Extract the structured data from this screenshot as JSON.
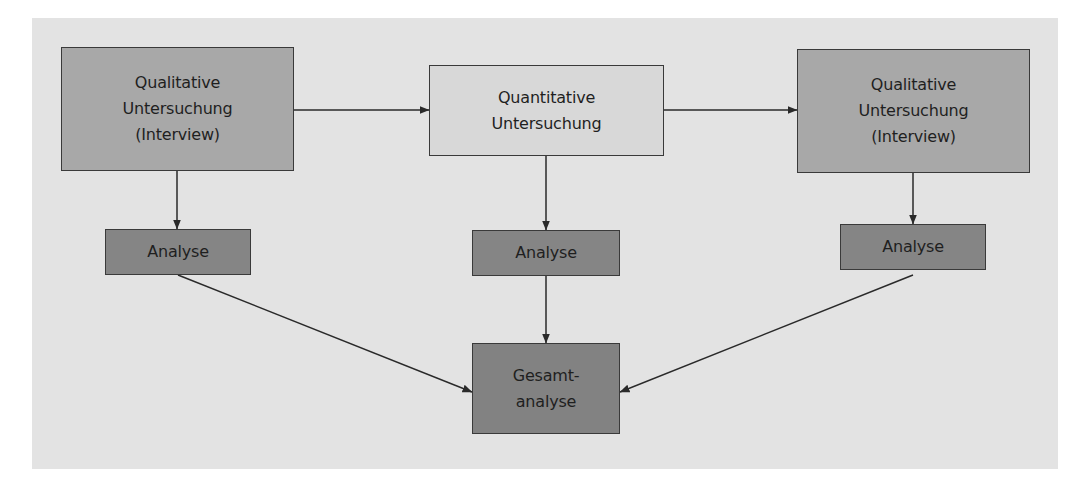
{
  "diagram": {
    "colors": {
      "background_panel": "#e3e3e3",
      "qualitative_box": "#a8a8a8",
      "quantitative_box": "#d8d8d8",
      "analyse_box": "#858585",
      "gesamt_box": "#828282",
      "line": "#2a2a2a"
    },
    "nodes": {
      "qual_1": {
        "lines": [
          "Qualitative",
          "Untersuchung",
          "(Interview)"
        ]
      },
      "quant": {
        "lines": [
          "Quantitative",
          "Untersuchung"
        ]
      },
      "qual_2": {
        "lines": [
          "Qualitative",
          "Untersuchung",
          "(Interview)"
        ]
      },
      "analyse_1": {
        "lines": [
          "Analyse"
        ]
      },
      "analyse_2": {
        "lines": [
          "Analyse"
        ]
      },
      "analyse_3": {
        "lines": [
          "Analyse"
        ]
      },
      "gesamt": {
        "lines": [
          "Gesamt-",
          "analyse"
        ]
      }
    },
    "edges": [
      {
        "from": "qual_1",
        "to": "quant"
      },
      {
        "from": "quant",
        "to": "qual_2"
      },
      {
        "from": "qual_1",
        "to": "analyse_1"
      },
      {
        "from": "quant",
        "to": "analyse_2"
      },
      {
        "from": "qual_2",
        "to": "analyse_3"
      },
      {
        "from": "analyse_1",
        "to": "gesamt"
      },
      {
        "from": "analyse_2",
        "to": "gesamt"
      },
      {
        "from": "analyse_3",
        "to": "gesamt"
      }
    ]
  }
}
